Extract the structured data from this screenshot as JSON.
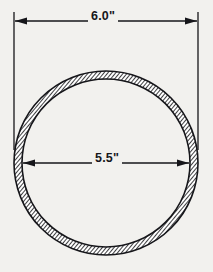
{
  "drawing": {
    "type": "pipe-cross-section",
    "background_color": "#f2f1ee",
    "line_color": "#16161a",
    "hatch_color": "#1d1d20",
    "dimensions": {
      "outer": {
        "label": "6.0\"",
        "value": 6.0,
        "unit": "inch",
        "position": "top",
        "arrow_style": "solid-filled-inward"
      },
      "inner": {
        "label": "5.5\"",
        "value": 5.5,
        "unit": "inch",
        "position": "center",
        "arrow_style": "solid-filled-outward"
      }
    },
    "geometry": {
      "center_x": 106,
      "center_y": 163,
      "outer_radius": 92,
      "inner_radius": 84,
      "wall_thickness": 8,
      "hatch_angle_deg": 45,
      "hatch_spacing": 3
    },
    "annotations": {
      "outer_dimension_line_y": 21,
      "outer_extension_left_x": 14,
      "outer_extension_right_x": 198,
      "inner_dimension_line_y": 163
    }
  }
}
